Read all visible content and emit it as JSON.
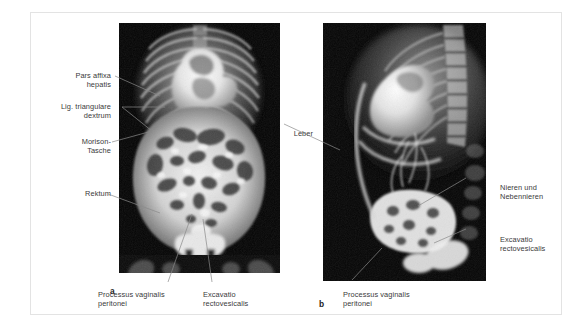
{
  "figure": {
    "panels": [
      {
        "letter": "a",
        "view": "anteroposterior",
        "labels": [
          {
            "name": "pars-affixa-hepatis",
            "text": "Pars affixa\nhepatis",
            "align": "right"
          },
          {
            "name": "lig-triangulare-dextrum",
            "text": "Lig. triangulare\ndextrum",
            "align": "right"
          },
          {
            "name": "morison-tasche",
            "text": "Morison-\nTasche",
            "align": "right"
          },
          {
            "name": "rektum",
            "text": "Rektum",
            "align": "right"
          },
          {
            "name": "processus-vaginalis-peritonei",
            "text": "Processus vaginalis\nperitonei",
            "align": "left"
          },
          {
            "name": "excavatio-rectovesicalis",
            "text": "Excavatio\nrectovesicalis",
            "align": "left"
          }
        ]
      },
      {
        "letter": "b",
        "view": "lateral",
        "labels": [
          {
            "name": "leber",
            "text": "Leber",
            "align": "right"
          },
          {
            "name": "nieren-und-nebennieren",
            "text": "Nieren und\nNebennieren",
            "align": "left"
          },
          {
            "name": "excavatio-rectovesicalis",
            "text": "Excavatio\nrectovesicalis",
            "align": "left"
          },
          {
            "name": "processus-vaginalis-peritonei",
            "text": "Processus vaginalis\nperitonei",
            "align": "left"
          }
        ]
      }
    ],
    "colors": {
      "label_text": "#3a3a3a",
      "panel_letter": "#1a1a1a",
      "frame_border": "#e3e3e3",
      "leader_line": "#8a8a8a",
      "radiograph_background": "#000000",
      "page_background": "#ffffff"
    }
  }
}
